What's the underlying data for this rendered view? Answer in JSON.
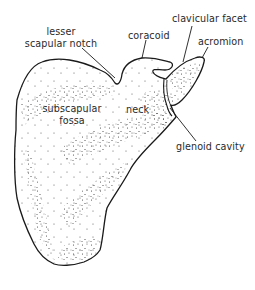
{
  "figure": {
    "colors": {
      "outline": "#1a1a1a",
      "stipple": "#3a3a3a",
      "text": "#2a2a2a",
      "background": "#ffffff"
    },
    "labels": {
      "lesser_scapular_notch_line1": "lesser",
      "lesser_scapular_notch_line2": "scapular notch",
      "coracoid": "coracoid",
      "clavicular_facet": "clavicular facet",
      "acromion": "acromion",
      "subscapular_fossa_line1": "subscapular",
      "subscapular_fossa_line2": "fossa",
      "neck": "neck",
      "glenoid_cavity": "glenoid cavity"
    }
  }
}
